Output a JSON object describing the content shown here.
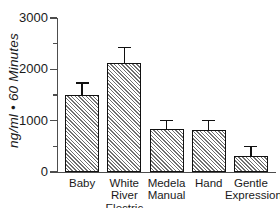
{
  "chart_data": {
    "type": "bar",
    "title": "",
    "subtitle": "",
    "xlabel": "",
    "ylabel": "ng/ml • 60 Minutes",
    "categories": [
      "Baby",
      "White River Electric",
      "Medela Manual",
      "Hand",
      "Gentle Expressions"
    ],
    "category_lines": [
      [
        "Baby"
      ],
      [
        "White",
        "River",
        "Electric"
      ],
      [
        "Medela",
        "Manual"
      ],
      [
        "Hand"
      ],
      [
        "Gentle",
        "Expressions"
      ]
    ],
    "values": [
      1500,
      2120,
      840,
      820,
      320
    ],
    "errors": [
      230,
      310,
      160,
      180,
      180
    ],
    "ylim": [
      0,
      3000
    ],
    "ytick_labels": [
      "0",
      "1000",
      "2000",
      "3000"
    ],
    "ytick_values": [
      0,
      1000,
      2000,
      3000
    ],
    "yminor_tick_values": [
      500,
      1500,
      2500
    ],
    "grid": false,
    "legend": null,
    "series": [
      {
        "name": "",
        "values": [
          1500,
          2120,
          840,
          820,
          320
        ],
        "errors": [
          230,
          310,
          160,
          180,
          180
        ]
      }
    ],
    "bar_fill": "diagonal-hatch",
    "bar_outline_color": "#111111",
    "axis_color": "#4d4d4d",
    "text_color": "#1a1a1a"
  }
}
